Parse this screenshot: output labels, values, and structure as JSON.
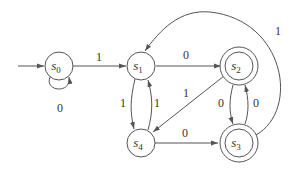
{
  "diagram": {
    "type": "finite-state-automaton",
    "start_state": "s0",
    "states": [
      {
        "id": "s0",
        "name": "s",
        "sub": "0",
        "accepting": false
      },
      {
        "id": "s1",
        "name": "s",
        "sub": "1",
        "accepting": false
      },
      {
        "id": "s2",
        "name": "s",
        "sub": "2",
        "accepting": true
      },
      {
        "id": "s3",
        "name": "s",
        "sub": "3",
        "accepting": true
      },
      {
        "id": "s4",
        "name": "s",
        "sub": "4",
        "accepting": false
      }
    ],
    "transitions": [
      {
        "from": "s0",
        "to": "s0",
        "label": "0"
      },
      {
        "from": "s0",
        "to": "s1",
        "label": "1"
      },
      {
        "from": "s1",
        "to": "s2",
        "label": "0"
      },
      {
        "from": "s1",
        "to": "s4",
        "label": "1"
      },
      {
        "from": "s4",
        "to": "s1",
        "label": "1"
      },
      {
        "from": "s2",
        "to": "s4",
        "label": "1"
      },
      {
        "from": "s2",
        "to": "s3",
        "label": "0"
      },
      {
        "from": "s3",
        "to": "s2",
        "label": "0"
      },
      {
        "from": "s4",
        "to": "s3",
        "label": "0"
      },
      {
        "from": "s3",
        "to": "s1",
        "label": "1"
      }
    ]
  },
  "colors": {
    "stroke": "#555555",
    "text": "#333333",
    "background": "#ffffff"
  }
}
